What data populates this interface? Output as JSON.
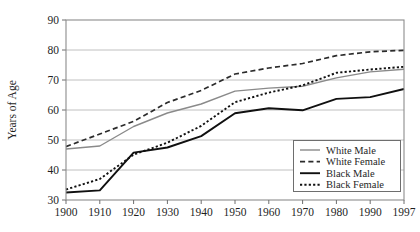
{
  "chart_data": {
    "type": "line",
    "title": "",
    "xlabel": "",
    "ylabel": "Years of Age",
    "xlim": [
      1900,
      1997
    ],
    "ylim": [
      30,
      90
    ],
    "grid": true,
    "legend_position": "bottom-right",
    "x": [
      1900,
      1910,
      1920,
      1930,
      1940,
      1950,
      1960,
      1970,
      1980,
      1990,
      1997
    ],
    "xtick_labels": [
      "1900",
      "1910",
      "1920",
      "1930",
      "1940",
      "1950",
      "1960",
      "1970",
      "1980",
      "1990",
      "1997"
    ],
    "ytick_labels": [
      "30",
      "40",
      "50",
      "60",
      "70",
      "80",
      "90"
    ],
    "yticks": [
      30,
      40,
      50,
      60,
      70,
      80,
      90
    ],
    "series": [
      {
        "name": "White Male",
        "style": "solid",
        "color": "#8a8a8a",
        "width": 1.4,
        "values": [
          47.0,
          48.0,
          54.5,
          59.0,
          62.0,
          66.3,
          67.3,
          67.9,
          70.7,
          72.7,
          73.6
        ]
      },
      {
        "name": "White Female",
        "style": "dashed",
        "color": "#2b2b2b",
        "width": 1.7,
        "values": [
          47.8,
          52.0,
          56.2,
          62.5,
          66.5,
          72.0,
          74.0,
          75.5,
          78.1,
          79.4,
          79.9
        ]
      },
      {
        "name": "Black Male",
        "style": "solid",
        "color": "#101010",
        "width": 1.9,
        "values": [
          32.5,
          33.2,
          45.8,
          47.5,
          51.3,
          58.9,
          60.6,
          59.9,
          63.7,
          64.3,
          67.0
        ]
      },
      {
        "name": "Black Female",
        "style": "dotted",
        "color": "#101010",
        "width": 1.9,
        "values": [
          33.5,
          37.0,
          45.1,
          49.1,
          54.7,
          62.6,
          65.8,
          68.2,
          72.4,
          73.5,
          74.4
        ]
      }
    ]
  },
  "legend": {
    "entries": [
      {
        "label": "White Male"
      },
      {
        "label": "White Female"
      },
      {
        "label": "Black Male"
      },
      {
        "label": "Black Female"
      }
    ]
  }
}
